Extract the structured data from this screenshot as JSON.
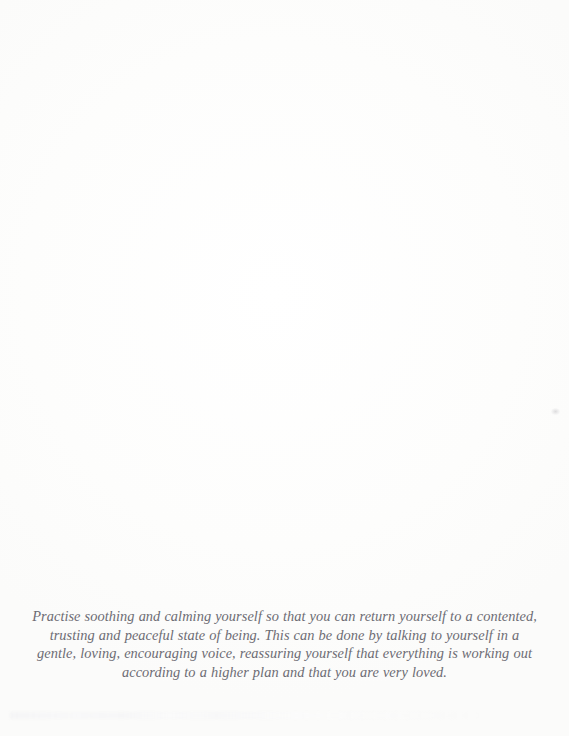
{
  "page": {
    "background_color": "#fdfdfc",
    "ink_color": "#6d6c74",
    "kind": "scanned-book-page"
  },
  "passage": {
    "full_text": "Practise soothing and calming yourself so that you can return yourself to a contented, trusting and peaceful state of being. This can be done by talking to yourself in a gentle, loving, encouraging voice, reassuring yourself that everything is working out according to a higher plan and that you are very loved.",
    "lines": [
      "Practise soothing and calming yourself so that you can return yourself to a contented,",
      "trusting and peaceful state of being. This can be done by talking to yourself in a",
      "gentle, loving, encouraging voice, reassuring yourself that everything is working out",
      "according to a higher plan and that you are very loved."
    ]
  },
  "artifacts": {
    "speck_label": "",
    "bleed_through_label": ""
  }
}
